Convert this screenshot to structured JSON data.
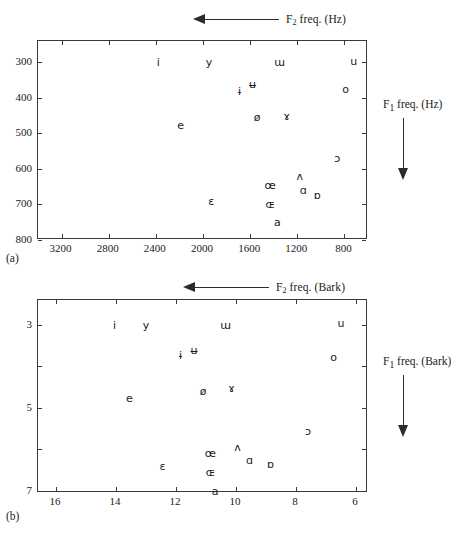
{
  "figure": {
    "panels": [
      {
        "id": "a",
        "panel_label": "(a)",
        "top_axis_caption": "F2 freq. (Hz)",
        "top_axis_caption_base": "F",
        "top_axis_caption_sub": "2",
        "top_axis_caption_rest": " freq. (Hz)",
        "side_axis_caption_base": "F",
        "side_axis_caption_sub": "1",
        "side_axis_caption_rest": " freq. (Hz)",
        "arrow_top": "left-arrow-icon",
        "arrow_side": "down-arrow-icon"
      },
      {
        "id": "b",
        "panel_label": "(b)",
        "top_axis_caption": "F2 freq. (Bark)",
        "top_axis_caption_base": "F",
        "top_axis_caption_sub": "2",
        "top_axis_caption_rest": " freq. (Bark)",
        "side_axis_caption_base": "F",
        "side_axis_caption_sub": "1",
        "side_axis_caption_rest": " freq. (Bark)",
        "arrow_top": "left-arrow-icon",
        "arrow_side": "down-arrow-icon"
      }
    ]
  },
  "chart_data": [
    {
      "type": "scatter",
      "title": "",
      "panel": "(a)",
      "xlabel": "F2 freq. (Hz)",
      "ylabel": "F1 freq. (Hz)",
      "xlim": [
        3400,
        600
      ],
      "ylim": [
        240,
        800
      ],
      "x_reversed": true,
      "y_reversed": true,
      "grid": false,
      "legend": "none",
      "xticks": [
        3200,
        2800,
        2400,
        2000,
        1600,
        1200,
        800
      ],
      "xticklabels": [
        "3200",
        "2800",
        "2400",
        "2000",
        "1600",
        "1200",
        "800"
      ],
      "yticks": [
        300,
        400,
        500,
        600,
        700,
        800
      ],
      "yticklabels": [
        "300",
        "400",
        "500",
        "600",
        "700",
        "800"
      ],
      "point_labels": [
        "i",
        "y",
        "ɨ",
        "ʉ",
        "ɯ",
        "u",
        "e",
        "ø",
        "ɤ",
        "o",
        "ɛ",
        "œ",
        "ʌ",
        "ɔ",
        "æ",
        "ɶ",
        "ɑ",
        "ɒ",
        "a"
      ],
      "points": [
        {
          "label": "i",
          "x": 2380,
          "y": 300
        },
        {
          "label": "y",
          "x": 1950,
          "y": 300
        },
        {
          "label": "ɯ",
          "x": 1350,
          "y": 300
        },
        {
          "label": "u",
          "x": 720,
          "y": 295
        },
        {
          "label": "ɨ",
          "x": 1690,
          "y": 380
        },
        {
          "label": "ʉ",
          "x": 1580,
          "y": 360
        },
        {
          "label": "o",
          "x": 790,
          "y": 375
        },
        {
          "label": "e",
          "x": 2190,
          "y": 475
        },
        {
          "label": "ø",
          "x": 1540,
          "y": 455
        },
        {
          "label": "ɤ",
          "x": 1290,
          "y": 450
        },
        {
          "label": "ɔ",
          "x": 860,
          "y": 570
        },
        {
          "label": "ʌ",
          "x": 1180,
          "y": 620
        },
        {
          "label": "œ",
          "x": 1430,
          "y": 645
        },
        {
          "label": "ɑ",
          "x": 1150,
          "y": 660
        },
        {
          "label": "ɒ",
          "x": 1030,
          "y": 672
        },
        {
          "label": "ɛ",
          "x": 1930,
          "y": 690
        },
        {
          "label": "ɶ",
          "x": 1430,
          "y": 700
        },
        {
          "label": "a",
          "x": 1370,
          "y": 750
        }
      ]
    },
    {
      "type": "scatter",
      "title": "",
      "panel": "(b)",
      "xlabel": "F2 freq. (Bark)",
      "ylabel": "F1 freq. (Bark)",
      "xlim": [
        16.6,
        5.6
      ],
      "ylim": [
        2.4,
        7.05
      ],
      "x_reversed": true,
      "y_reversed": true,
      "grid": false,
      "legend": "none",
      "xticks": [
        16,
        14,
        12,
        10,
        8,
        6
      ],
      "xticklabels": [
        "16",
        "14",
        "12",
        "10",
        "8",
        "6"
      ],
      "yticks": [
        3,
        4,
        5,
        6,
        7
      ],
      "yticklabels": [
        "3",
        "",
        "5",
        "",
        "7"
      ],
      "point_labels": [
        "i",
        "y",
        "ɨ",
        "ʉ",
        "ɯ",
        "u",
        "e",
        "ø",
        "ɤ",
        "o",
        "ɛ",
        "œ",
        "ʌ",
        "ɔ",
        "ɶ",
        "ɑ",
        "ɒ",
        "a"
      ],
      "points": [
        {
          "label": "i",
          "x": 14.05,
          "y": 3.0
        },
        {
          "label": "y",
          "x": 13.0,
          "y": 3.0
        },
        {
          "label": "ɯ",
          "x": 10.35,
          "y": 3.0
        },
        {
          "label": "u",
          "x": 6.5,
          "y": 2.95
        },
        {
          "label": "ɨ",
          "x": 11.85,
          "y": 3.72
        },
        {
          "label": "ʉ",
          "x": 11.4,
          "y": 3.6
        },
        {
          "label": "o",
          "x": 6.75,
          "y": 3.78
        },
        {
          "label": "e",
          "x": 13.55,
          "y": 4.75
        },
        {
          "label": "ø",
          "x": 11.1,
          "y": 4.6
        },
        {
          "label": "ɤ",
          "x": 10.15,
          "y": 4.52
        },
        {
          "label": "ɔ",
          "x": 7.6,
          "y": 5.55
        },
        {
          "label": "ʌ",
          "x": 9.95,
          "y": 5.95
        },
        {
          "label": "œ",
          "x": 10.85,
          "y": 6.08
        },
        {
          "label": "ɑ",
          "x": 9.55,
          "y": 6.25
        },
        {
          "label": "ɒ",
          "x": 8.85,
          "y": 6.35
        },
        {
          "label": "ɛ",
          "x": 12.45,
          "y": 6.4
        },
        {
          "label": "ɶ",
          "x": 10.85,
          "y": 6.55
        },
        {
          "label": "a",
          "x": 10.7,
          "y": 7.0
        }
      ]
    }
  ]
}
